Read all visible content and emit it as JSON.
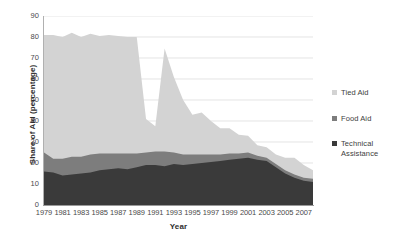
{
  "chart_data": {
    "type": "area",
    "stacked": true,
    "title": "",
    "xlabel": "Year",
    "ylabel": "Share of Aid (percentage)",
    "ylim": [
      0,
      90
    ],
    "ytick_step": 10,
    "yticks": [
      0,
      10,
      20,
      30,
      40,
      50,
      60,
      70,
      80,
      90
    ],
    "xlim": [
      1979,
      2008
    ],
    "x": [
      1979,
      1980,
      1981,
      1982,
      1983,
      1984,
      1985,
      1986,
      1987,
      1988,
      1989,
      1990,
      1991,
      1992,
      1993,
      1994,
      1995,
      1996,
      1997,
      1998,
      1999,
      2000,
      2001,
      2002,
      2003,
      2004,
      2005,
      2006,
      2007,
      2008
    ],
    "xticks": [
      1979,
      1981,
      1983,
      1985,
      1987,
      1989,
      1991,
      1993,
      1995,
      1997,
      1999,
      2001,
      2003,
      2005,
      2007
    ],
    "grid": "horizontal",
    "legend_position": "right",
    "series": [
      {
        "name": "Technical Assistance",
        "color": "#3a3a3a",
        "values": [
          16.0,
          15.5,
          14.0,
          14.5,
          15.0,
          15.5,
          16.5,
          17.0,
          17.5,
          17.0,
          18.0,
          19.0,
          19.0,
          18.5,
          19.5,
          19.0,
          19.5,
          20.0,
          20.5,
          21.0,
          21.5,
          22.0,
          22.5,
          21.5,
          21.0,
          18.0,
          15.0,
          13.0,
          11.5,
          11.0
        ]
      },
      {
        "name": "Food Aid",
        "color": "#7d7d7d",
        "values": [
          9.0,
          6.5,
          8.0,
          8.5,
          8.0,
          8.5,
          8.0,
          7.5,
          7.0,
          7.5,
          6.5,
          6.0,
          6.5,
          7.0,
          5.5,
          5.0,
          4.5,
          4.0,
          3.5,
          3.0,
          3.0,
          2.5,
          2.5,
          2.0,
          1.5,
          1.5,
          1.5,
          1.5,
          1.5,
          1.5
        ]
      },
      {
        "name": "Tied Aid",
        "color": "#d3d3d3",
        "values": [
          56.0,
          59.0,
          58.0,
          59.0,
          57.0,
          57.5,
          56.0,
          56.5,
          56.0,
          55.5,
          55.5,
          16.0,
          12.0,
          49.0,
          36.0,
          26.0,
          19.0,
          20.0,
          16.0,
          12.5,
          12.0,
          9.0,
          8.0,
          5.0,
          5.0,
          4.5,
          6.0,
          8.0,
          6.0,
          4.0
        ]
      }
    ],
    "totals_note": ""
  },
  "legend": {
    "items": [
      {
        "label": "Tied Aid",
        "color": "#d3d3d3"
      },
      {
        "label": "Food Aid",
        "color": "#7d7d7d"
      },
      {
        "label": "Technical Assistance",
        "color": "#3a3a3a"
      }
    ]
  },
  "axes": {
    "x_title": "Year",
    "y_title": "Share of Aid (percentage)"
  }
}
